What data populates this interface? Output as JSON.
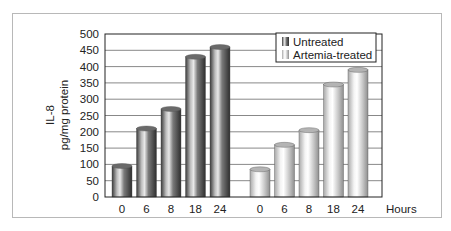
{
  "chart_data": {
    "type": "bar",
    "title": "",
    "ylabel": "IL-8 pg/mg protein",
    "ylabel_lines": [
      "IL-8",
      "pg/mg protein"
    ],
    "xlabel": "Hours",
    "categories": [
      "0",
      "6",
      "8",
      "18",
      "24"
    ],
    "series": [
      {
        "name": "Untreated",
        "values": [
          95,
          210,
          270,
          430,
          460
        ],
        "color": "#555555"
      },
      {
        "name": "Artemia-treated",
        "values": [
          85,
          160,
          205,
          345,
          390
        ],
        "color": "#d0d0d0"
      }
    ],
    "ylim": [
      0,
      500
    ],
    "yticks": [
      0,
      50,
      100,
      150,
      200,
      250,
      300,
      350,
      400,
      450,
      500
    ],
    "grid": true,
    "legend_position": "top-right",
    "layout": "grouped-by-series"
  }
}
